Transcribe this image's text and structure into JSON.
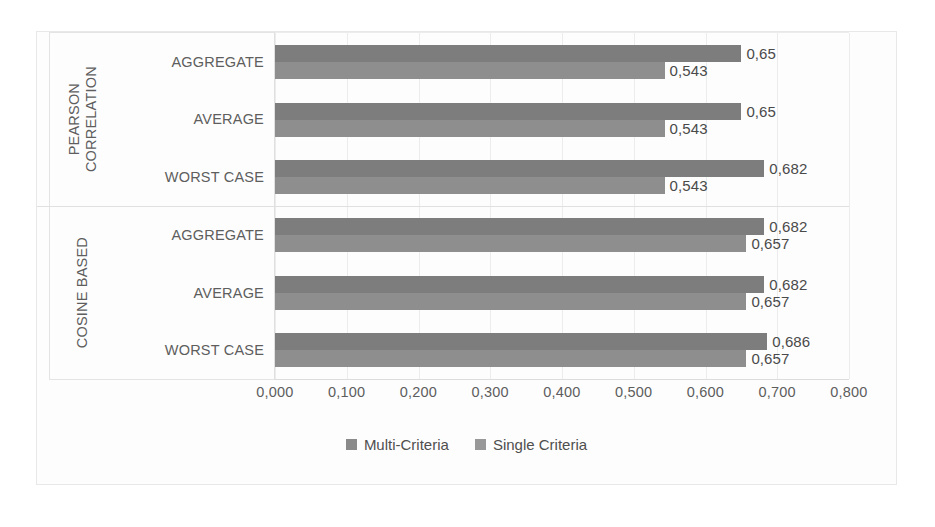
{
  "chart_data": {
    "type": "bar",
    "orientation": "horizontal",
    "title": "",
    "xlabel": "",
    "ylabel": "",
    "xlim": [
      0,
      0.8
    ],
    "grid": true,
    "legend_position": "bottom",
    "tick_labels": [
      "0,000",
      "0,100",
      "0,200",
      "0,300",
      "0,400",
      "0,500",
      "0,600",
      "0,700",
      "0,800"
    ],
    "tick_values": [
      0,
      0.1,
      0.2,
      0.3,
      0.4,
      0.5,
      0.6,
      0.7,
      0.8
    ],
    "series": [
      {
        "name": "Multi-Criteria",
        "color": "#7d7d7d",
        "values": [
          0.65,
          0.65,
          0.682,
          0.682,
          0.682,
          0.686
        ],
        "labels": [
          "0,65",
          "0,65",
          "0,682",
          "0,682",
          "0,682",
          "0,686"
        ]
      },
      {
        "name": "Single Criteria",
        "color": "#8e8e8e",
        "values": [
          0.543,
          0.543,
          0.543,
          0.657,
          0.657,
          0.657
        ],
        "labels": [
          "0,543",
          "0,543",
          "0,543",
          "0,657",
          "0,657",
          "0,657"
        ]
      }
    ],
    "categories": [
      "AGGREGATE",
      "AVERAGE",
      "WORST CASE",
      "AGGREGATE",
      "AVERAGE",
      "WORST CASE"
    ],
    "groups": [
      {
        "title": "PEARSON CORRELATION",
        "title_line1": "PEARSON",
        "title_line2": "CORRELATION",
        "categories": [
          "AGGREGATE",
          "AVERAGE",
          "WORST CASE"
        ],
        "bars": [
          {
            "category": "AGGREGATE",
            "multi": 0.65,
            "multi_label": "0,65",
            "single": 0.543,
            "single_label": "0,543"
          },
          {
            "category": "AVERAGE",
            "multi": 0.65,
            "multi_label": "0,65",
            "single": 0.543,
            "single_label": "0,543"
          },
          {
            "category": "WORST CASE",
            "multi": 0.682,
            "multi_label": "0,682",
            "single": 0.543,
            "single_label": "0,543"
          }
        ]
      },
      {
        "title": "COSINE BASED",
        "title_line1": "COSINE BASED",
        "title_line2": "",
        "categories": [
          "AGGREGATE",
          "AVERAGE",
          "WORST CASE"
        ],
        "bars": [
          {
            "category": "AGGREGATE",
            "multi": 0.682,
            "multi_label": "0,682",
            "single": 0.657,
            "single_label": "0,657"
          },
          {
            "category": "AVERAGE",
            "multi": 0.682,
            "multi_label": "0,682",
            "single": 0.657,
            "single_label": "0,657"
          },
          {
            "category": "WORST CASE",
            "multi": 0.686,
            "multi_label": "0,686",
            "single": 0.657,
            "single_label": "0,657"
          }
        ]
      }
    ]
  },
  "legend": {
    "items": [
      {
        "label": "Multi-Criteria",
        "color": "#8a8a8a"
      },
      {
        "label": "Single Criteria",
        "color": "#989898"
      }
    ]
  }
}
